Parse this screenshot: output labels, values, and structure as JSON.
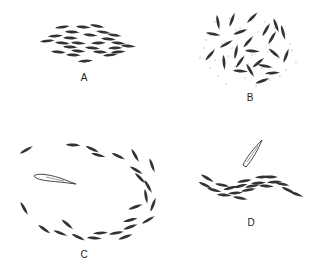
{
  "panels": [
    {
      "id": "A",
      "label": "A",
      "description": "tight school of small fish swimming in parallel"
    },
    {
      "id": "B",
      "label": "B",
      "description": "fish dispersed feeding among food particles"
    },
    {
      "id": "C",
      "label": "C",
      "description": "school forming a ring around a predator"
    },
    {
      "id": "D",
      "label": "D",
      "description": "school stretched into a line with a predator above"
    }
  ],
  "colors": {
    "ink": "#222222",
    "background": "#ffffff"
  }
}
